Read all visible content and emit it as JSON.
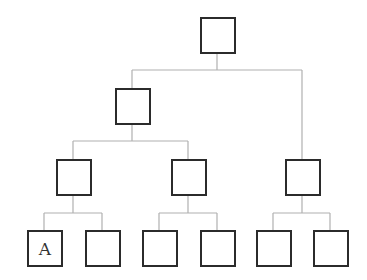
{
  "diagram": {
    "type": "tree",
    "colors": {
      "edge": "#b0b0b0",
      "node_border": "#2b2b2b",
      "background": "#ffffff"
    },
    "nodes": [
      {
        "id": "root",
        "label": "",
        "x": 200,
        "y": 17
      },
      {
        "id": "l2-left",
        "label": "",
        "x": 115,
        "y": 88
      },
      {
        "id": "l3-a",
        "label": "",
        "x": 56,
        "y": 159
      },
      {
        "id": "l3-b",
        "label": "",
        "x": 171,
        "y": 159
      },
      {
        "id": "l3-c",
        "label": "",
        "x": 285,
        "y": 159
      },
      {
        "id": "leaf-1",
        "label": "A",
        "x": 27,
        "y": 230
      },
      {
        "id": "leaf-2",
        "label": "",
        "x": 85,
        "y": 230
      },
      {
        "id": "leaf-3",
        "label": "",
        "x": 142,
        "y": 230
      },
      {
        "id": "leaf-4",
        "label": "",
        "x": 200,
        "y": 230
      },
      {
        "id": "leaf-5",
        "label": "",
        "x": 256,
        "y": 230
      },
      {
        "id": "leaf-6",
        "label": "",
        "x": 313,
        "y": 230
      }
    ]
  }
}
